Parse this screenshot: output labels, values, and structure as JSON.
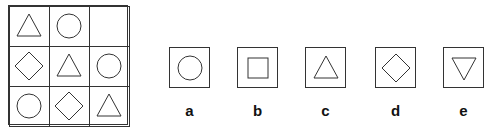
{
  "puzzle": {
    "grid": [
      [
        "triangle",
        "circle",
        "empty"
      ],
      [
        "diamond",
        "triangle",
        "circle"
      ],
      [
        "circle",
        "diamond",
        "triangle"
      ]
    ],
    "options": [
      {
        "label": "a",
        "shape": "circle"
      },
      {
        "label": "b",
        "shape": "square"
      },
      {
        "label": "c",
        "shape": "triangle"
      },
      {
        "label": "d",
        "shape": "diamond"
      },
      {
        "label": "e",
        "shape": "inverted-triangle"
      }
    ]
  }
}
